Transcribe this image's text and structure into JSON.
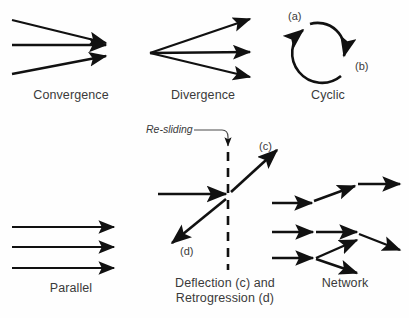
{
  "figure": {
    "background_color": "#fefefe",
    "stroke_color": "#111111",
    "text_color": "#3a3a3a"
  },
  "panels": {
    "convergence": {
      "caption": "Convergence",
      "caption_x": 16,
      "caption_y": 88,
      "caption_width": 110
    },
    "divergence": {
      "caption": "Divergence",
      "caption_x": 148,
      "caption_y": 88,
      "caption_width": 110
    },
    "cyclic": {
      "caption": "Cyclic",
      "caption_x": 283,
      "caption_y": 88,
      "caption_width": 90,
      "label_a": "(a)",
      "label_a_x": 288,
      "label_a_y": 10,
      "label_b": "(b)",
      "label_b_x": 355,
      "label_b_y": 60
    },
    "parallel": {
      "caption": "Parallel",
      "caption_x": 16,
      "caption_y": 281,
      "caption_width": 110
    },
    "deflection": {
      "caption_line1": "Deflection (c) and",
      "caption_line2": "Retrogression (d)",
      "caption_x": 150,
      "caption_y": 276,
      "caption_width": 150,
      "annotation": "Re-sliding",
      "annotation_x": 146,
      "annotation_y": 126,
      "label_c": "(c)",
      "label_c_x": 259,
      "label_c_y": 140,
      "label_d": "(d)",
      "label_d_x": 180,
      "label_d_y": 245
    },
    "network": {
      "caption": "Network",
      "caption_x": 300,
      "caption_y": 276,
      "caption_width": 90
    }
  },
  "geometry": {
    "convergence": {
      "arrows": [
        {
          "x1": 12,
          "y1": 20,
          "x2": 106,
          "y2": 43
        },
        {
          "x1": 12,
          "y1": 45,
          "x2": 106,
          "y2": 45
        },
        {
          "x1": 12,
          "y1": 74,
          "x2": 106,
          "y2": 56
        }
      ]
    },
    "divergence": {
      "origin_x": 150,
      "origin_y": 53,
      "arrows": [
        {
          "x1": 150,
          "y1": 53,
          "x2": 250,
          "y2": 19
        },
        {
          "x1": 150,
          "y1": 53,
          "x2": 250,
          "y2": 52
        },
        {
          "x1": 150,
          "y1": 53,
          "x2": 250,
          "y2": 77
        }
      ]
    },
    "cyclic": {
      "center_x": 327,
      "center_y": 48,
      "radius": 27
    },
    "parallel": {
      "arrows": [
        {
          "x1": 12,
          "y1": 227,
          "x2": 114,
          "y2": 227
        },
        {
          "x1": 12,
          "y1": 247,
          "x2": 114,
          "y2": 247
        },
        {
          "x1": 12,
          "y1": 268,
          "x2": 114,
          "y2": 268
        }
      ]
    },
    "deflection": {
      "dashed_line": {
        "x": 228,
        "y1": 152,
        "y2": 270
      },
      "incoming": {
        "x1": 158,
        "y1": 194,
        "x2": 226,
        "y2": 194
      },
      "arrow_c": {
        "x1": 231,
        "y1": 192,
        "x2": 277,
        "y2": 150
      },
      "arrow_d": {
        "x1": 226,
        "y1": 199,
        "x2": 172,
        "y2": 243
      }
    },
    "network": {
      "arrows": [
        {
          "x1": 272,
          "y1": 203,
          "x2": 312,
          "y2": 203
        },
        {
          "x1": 314,
          "y1": 201,
          "x2": 355,
          "y2": 186
        },
        {
          "x1": 358,
          "y1": 184,
          "x2": 400,
          "y2": 184
        },
        {
          "x1": 272,
          "y1": 232,
          "x2": 313,
          "y2": 232
        },
        {
          "x1": 316,
          "y1": 232,
          "x2": 357,
          "y2": 232
        },
        {
          "x1": 359,
          "y1": 234,
          "x2": 400,
          "y2": 250
        },
        {
          "x1": 272,
          "y1": 258,
          "x2": 313,
          "y2": 258
        },
        {
          "x1": 316,
          "y1": 258,
          "x2": 357,
          "y2": 240
        },
        {
          "x1": 316,
          "y1": 259,
          "x2": 357,
          "y2": 273
        }
      ]
    }
  }
}
